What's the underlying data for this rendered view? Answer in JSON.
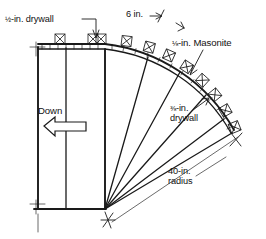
{
  "figure": {
    "kind": "construction-detail-drawing",
    "width_px": 266,
    "height_px": 239,
    "ink_color": "#1a1a1a",
    "background_color": "#ffffff"
  },
  "labels": {
    "top_drywall": {
      "numerator": "1",
      "denominator": "2",
      "fraction_glyph": "½",
      "text": "-in. drywall",
      "full": "½-in. drywall",
      "leader": "line-with-arrow-down"
    },
    "six_in": {
      "text": "6 in.",
      "leader": "short-arrow-right"
    },
    "masonite": {
      "fraction_glyph": "⅛",
      "text": "-in. Masonite",
      "full": "⅛-in. Masonite",
      "leader": "diagonal-arrow-down-left"
    },
    "side_drywall": {
      "fraction_glyph": "⅜",
      "text": "-in.",
      "second_line": "drywall",
      "full": "⅜-in. drywall",
      "leader": "short-arrow-up-right"
    },
    "radius": {
      "line1": "40-in.",
      "line2": "radius",
      "full": "40-in. radius",
      "leader": "long-dimension-line-with-tick-crosses"
    },
    "down": {
      "text": "Down",
      "arrow": "hollow-block-arrow-left"
    }
  },
  "geometry": {
    "pivot_point": {
      "x": 105,
      "y": 210,
      "marker": "asterisk-cross"
    },
    "arc_radius_px": 168,
    "arc_start": {
      "x": 38,
      "y": 47
    },
    "arc_end": {
      "x": 232,
      "y": 131
    },
    "vertical_studs_x": [
      38,
      66,
      105
    ],
    "base_line_y": 209,
    "radial_lines_count": 5,
    "clamp_count": 12
  },
  "annotations": {
    "clamp_symbol_name": "spring-clamp",
    "hatch_band_name": "masonite-skin-hatch"
  }
}
